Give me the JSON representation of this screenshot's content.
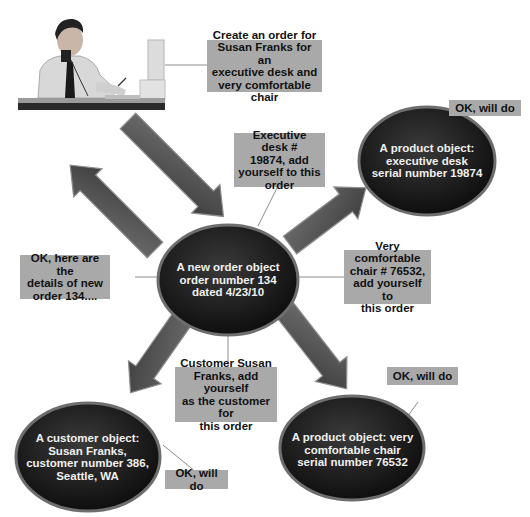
{
  "diagram": {
    "actor": {
      "icon": "person-on-phone-at-desk-icon"
    },
    "messages": {
      "create_order": "Create an order for\nSusan Franks for an\nexecutive desk and\nvery comfortable chair",
      "desk_add": "Executive desk #\n19874, add\nyourself to this\norder",
      "chair_add": "Very comfortable\nchair # 76532,\nadd yourself to\nthis order",
      "customer_add": "Customer Susan\nFranks, add yourself\nas the customer for\nthis order",
      "order_details": "OK, here are the\ndetails of new\norder 134....",
      "ok_desk": "OK, will do",
      "ok_chair": "OK, will do",
      "ok_customer": "OK, will do"
    },
    "objects": {
      "order": "A new order object\norder number 134\ndated 4/23/10",
      "desk": "A product object:\nexecutive desk\nserial number 19874",
      "chair": "A product object: very\ncomfortable chair\nserial number 76532",
      "customer": "A customer object:\nSusan Franks,\ncustomer number 386,\nSeattle, WA"
    },
    "colors": {
      "message_box": "#a9a9a9",
      "oval_dark": "#1e1e1e",
      "oval_rim": "#6a6a6a",
      "arrow": "#555555",
      "connector": "#8a8a8a"
    }
  }
}
